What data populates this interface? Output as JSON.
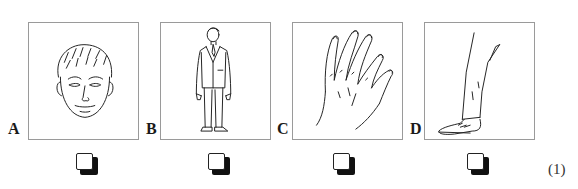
{
  "question": {
    "number_label": "(1)",
    "options": [
      {
        "letter": "A",
        "picture": "face-drawing",
        "checked": false
      },
      {
        "letter": "B",
        "picture": "standing-man-drawing",
        "checked": false
      },
      {
        "letter": "C",
        "picture": "hand-drawing",
        "checked": false
      },
      {
        "letter": "D",
        "picture": "leg-and-shoe-drawing",
        "checked": false
      }
    ]
  },
  "colors": {
    "frame_border": "#9a9a9a",
    "ink": "#222222",
    "background": "#ffffff"
  }
}
